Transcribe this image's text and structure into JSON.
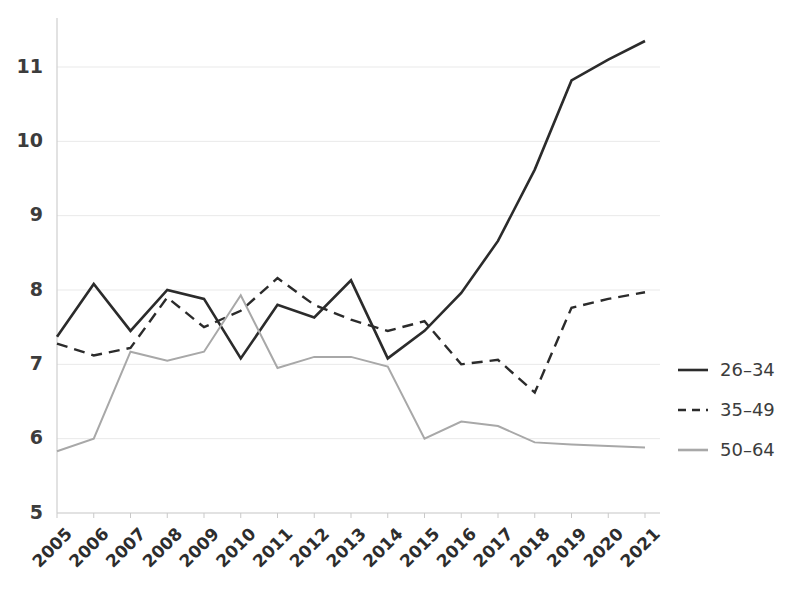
{
  "chart_data": {
    "type": "line",
    "title": "",
    "subtitle": "",
    "xlabel": "",
    "ylabel": "",
    "categories": [
      "2005",
      "2006",
      "2007",
      "2008",
      "2009",
      "2010",
      "2011",
      "2012",
      "2013",
      "2014",
      "2015",
      "2016",
      "2017",
      "2018",
      "2019",
      "2020",
      "2021"
    ],
    "x": [
      2005,
      2006,
      2007,
      2008,
      2009,
      2010,
      2011,
      2012,
      2013,
      2014,
      2015,
      2016,
      2017,
      2018,
      2019,
      2020,
      2021
    ],
    "ylim": [
      5,
      11.6
    ],
    "yticks": [
      5,
      6,
      7,
      8,
      9,
      10,
      11
    ],
    "ytick_labels": [
      "5",
      "6",
      "7",
      "8",
      "9",
      "10",
      "11"
    ],
    "grid": true,
    "legend_position": "right",
    "series": [
      {
        "name": "26-34",
        "style": "solid",
        "color": "#2b2b2b",
        "width": 2.6,
        "values": [
          7.37,
          8.08,
          7.45,
          8.0,
          7.88,
          7.08,
          7.8,
          7.63,
          8.13,
          7.08,
          7.45,
          7.96,
          8.66,
          9.62,
          10.82,
          11.1,
          11.35
        ]
      },
      {
        "name": "35-49",
        "style": "dashed",
        "color": "#2b2b2b",
        "width": 2.4,
        "values": [
          7.28,
          7.12,
          7.22,
          7.9,
          7.5,
          7.72,
          8.16,
          7.8,
          7.6,
          7.45,
          7.58,
          7.0,
          7.06,
          6.62,
          7.76,
          7.88,
          7.97
        ]
      },
      {
        "name": "50-64",
        "style": "solid",
        "color": "#a8a8a8",
        "width": 2.0,
        "values": [
          5.83,
          6.0,
          7.17,
          7.05,
          7.17,
          7.93,
          6.95,
          7.1,
          7.1,
          6.97,
          6.0,
          6.23,
          6.17,
          5.95,
          5.92,
          5.9,
          5.88
        ]
      }
    ],
    "legend": [
      {
        "label": "26-34",
        "style": "solid",
        "color": "#2b2b2b"
      },
      {
        "label": "35-49",
        "style": "dashed",
        "color": "#2b2b2b"
      },
      {
        "label": "50-64",
        "style": "solid",
        "color": "#a8a8a8"
      }
    ],
    "colors": {
      "grid": "#e9e9e9",
      "axis": "#cfcfcf",
      "text": "#3c3c3c",
      "series_dark": "#2b2b2b",
      "series_gray": "#a8a8a8",
      "background": "#ffffff"
    }
  }
}
